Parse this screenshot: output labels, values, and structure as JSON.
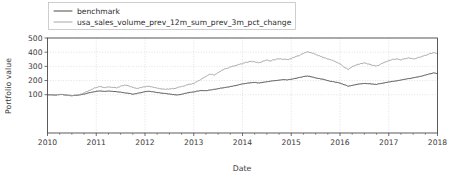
{
  "chart_data": {
    "type": "line",
    "title": "",
    "xlabel": "Date",
    "ylabel": "Portfolio value",
    "xlim": [
      2010.0,
      2018.0
    ],
    "ylim": [
      -170,
      500
    ],
    "grid": true,
    "legend_position": "upper left",
    "xticks": [
      "2010",
      "2011",
      "2012",
      "2013",
      "2014",
      "2015",
      "2016",
      "2017",
      "2018"
    ],
    "xtick_values": [
      2010,
      2011,
      2012,
      2013,
      2014,
      2015,
      2016,
      2017,
      2018
    ],
    "yticks": [
      "100",
      "200",
      "300",
      "400",
      "500"
    ],
    "ytick_values": [
      100,
      200,
      300,
      400,
      500
    ],
    "minor_xticks_per_interval": 3,
    "colors": {
      "benchmark": "#4d4d4d",
      "strategy": "#a6a6a6"
    },
    "series": [
      {
        "name": "benchmark",
        "color": "#4d4d4d",
        "x": [
          2010.0,
          2010.08,
          2010.17,
          2010.25,
          2010.33,
          2010.42,
          2010.5,
          2010.58,
          2010.67,
          2010.75,
          2010.83,
          2010.92,
          2011.0,
          2011.08,
          2011.17,
          2011.25,
          2011.33,
          2011.42,
          2011.5,
          2011.58,
          2011.67,
          2011.75,
          2011.83,
          2011.92,
          2012.0,
          2012.08,
          2012.17,
          2012.25,
          2012.33,
          2012.42,
          2012.5,
          2012.58,
          2012.67,
          2012.75,
          2012.83,
          2012.92,
          2013.0,
          2013.08,
          2013.17,
          2013.25,
          2013.33,
          2013.42,
          2013.5,
          2013.58,
          2013.67,
          2013.75,
          2013.83,
          2013.92,
          2014.0,
          2014.08,
          2014.17,
          2014.25,
          2014.33,
          2014.42,
          2014.5,
          2014.58,
          2014.67,
          2014.75,
          2014.83,
          2014.92,
          2015.0,
          2015.08,
          2015.17,
          2015.25,
          2015.33,
          2015.42,
          2015.5,
          2015.58,
          2015.67,
          2015.75,
          2015.83,
          2015.92,
          2016.0,
          2016.08,
          2016.17,
          2016.25,
          2016.33,
          2016.42,
          2016.5,
          2016.58,
          2016.67,
          2016.75,
          2016.83,
          2016.92,
          2017.0,
          2017.08,
          2017.17,
          2017.25,
          2017.33,
          2017.42,
          2017.5,
          2017.58,
          2017.67,
          2017.75,
          2017.83,
          2017.92,
          2018.0
        ],
        "values": [
          100,
          99,
          97,
          102,
          100,
          96,
          93,
          95,
          99,
          104,
          112,
          118,
          124,
          127,
          123,
          126,
          124,
          121,
          118,
          113,
          110,
          104,
          108,
          115,
          121,
          124,
          120,
          116,
          112,
          108,
          105,
          101,
          98,
          103,
          110,
          116,
          120,
          126,
          130,
          128,
          133,
          138,
          143,
          148,
          152,
          157,
          163,
          170,
          176,
          180,
          184,
          186,
          183,
          187,
          192,
          196,
          199,
          203,
          207,
          204,
          209,
          215,
          221,
          228,
          232,
          226,
          219,
          213,
          207,
          199,
          193,
          188,
          182,
          172,
          160,
          166,
          172,
          176,
          180,
          178,
          175,
          173,
          179,
          185,
          190,
          194,
          198,
          203,
          209,
          214,
          219,
          224,
          231,
          238,
          246,
          254,
          249
        ]
      },
      {
        "name": "usa_sales_volume_prev_12m_sum_prev_3m_pct_change",
        "color": "#a6a6a6",
        "x": [
          2010.0,
          2010.08,
          2010.17,
          2010.25,
          2010.33,
          2010.42,
          2010.5,
          2010.58,
          2010.67,
          2010.75,
          2010.83,
          2010.92,
          2011.0,
          2011.08,
          2011.17,
          2011.25,
          2011.33,
          2011.42,
          2011.5,
          2011.58,
          2011.67,
          2011.75,
          2011.83,
          2011.92,
          2012.0,
          2012.08,
          2012.17,
          2012.25,
          2012.33,
          2012.42,
          2012.5,
          2012.58,
          2012.67,
          2012.75,
          2012.83,
          2012.92,
          2013.0,
          2013.08,
          2013.17,
          2013.25,
          2013.33,
          2013.42,
          2013.5,
          2013.58,
          2013.67,
          2013.75,
          2013.83,
          2013.92,
          2014.0,
          2014.08,
          2014.17,
          2014.25,
          2014.33,
          2014.42,
          2014.5,
          2014.58,
          2014.67,
          2014.75,
          2014.83,
          2014.92,
          2015.0,
          2015.08,
          2015.17,
          2015.25,
          2015.33,
          2015.42,
          2015.5,
          2015.58,
          2015.67,
          2015.75,
          2015.83,
          2015.92,
          2016.0,
          2016.08,
          2016.17,
          2016.25,
          2016.33,
          2016.42,
          2016.5,
          2016.58,
          2016.67,
          2016.75,
          2016.83,
          2016.92,
          2017.0,
          2017.08,
          2017.17,
          2017.25,
          2017.33,
          2017.42,
          2017.5,
          2017.58,
          2017.67,
          2017.75,
          2017.83,
          2017.92,
          2018.0
        ],
        "values": [
          100,
          99,
          97,
          102,
          100,
          96,
          94,
          97,
          103,
          112,
          126,
          140,
          152,
          158,
          150,
          156,
          152,
          148,
          160,
          168,
          162,
          150,
          146,
          150,
          156,
          160,
          154,
          148,
          142,
          138,
          140,
          144,
          150,
          158,
          166,
          174,
          180,
          196,
          214,
          228,
          246,
          238,
          256,
          272,
          286,
          294,
          302,
          312,
          320,
          328,
          336,
          332,
          326,
          336,
          344,
          340,
          348,
          354,
          350,
          346,
          356,
          366,
          378,
          392,
          402,
          396,
          386,
          374,
          362,
          352,
          344,
          330,
          318,
          296,
          278,
          296,
          310,
          318,
          324,
          316,
          308,
          302,
          314,
          330,
          340,
          348,
          352,
          346,
          354,
          360,
          352,
          360,
          370,
          378,
          388,
          396,
          390
        ]
      }
    ]
  },
  "legend": {
    "entries": [
      {
        "label": "benchmark"
      },
      {
        "label": "usa_sales_volume_prev_12m_sum_prev_3m_pct_change"
      }
    ]
  }
}
